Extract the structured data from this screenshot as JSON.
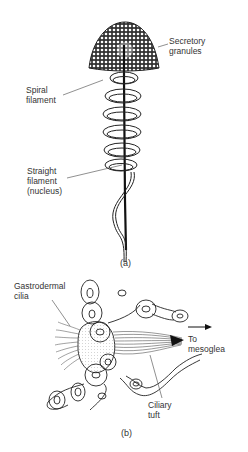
{
  "figure_a": {
    "caption": "(a)",
    "labels": {
      "secretory_granules": "Secretory\ngranules",
      "spiral_filament": "Spiral\nfilament",
      "straight_filament": "Straight\nfilament\n(nucleus)"
    }
  },
  "figure_b": {
    "caption": "(b)",
    "labels": {
      "gastrodermal_cilia": "Gastrodermal\ncilia",
      "to_mesoglea": "To\nmesoglea",
      "ciliary_tuft": "Ciliary\ntuft"
    }
  },
  "colors": {
    "ink": "#222222",
    "background": "#ffffff"
  }
}
